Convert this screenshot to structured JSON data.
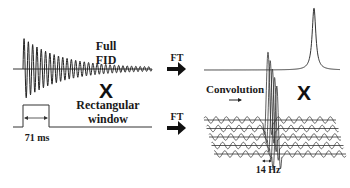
{
  "diagram": {
    "left_top": {
      "signal": "decaying-oscillation",
      "label_line1": "Full",
      "label_line2": "FID"
    },
    "left_multiply": "X",
    "left_bottom": {
      "signal": "rectangular-window",
      "label_line1": "Rectangular",
      "label_line2": "window",
      "duration_label": "71 ms"
    },
    "transforms": [
      {
        "label": "FT",
        "position": "top"
      },
      {
        "label": "FT",
        "position": "bottom"
      }
    ],
    "right_top": {
      "signal": "narrow-lorentzian-peak"
    },
    "right_multiply": "X",
    "right_bottom": {
      "signal": "sinc-function-convolution",
      "convolution_label": "Convolution",
      "linewidth_label": "14 Hz"
    }
  }
}
